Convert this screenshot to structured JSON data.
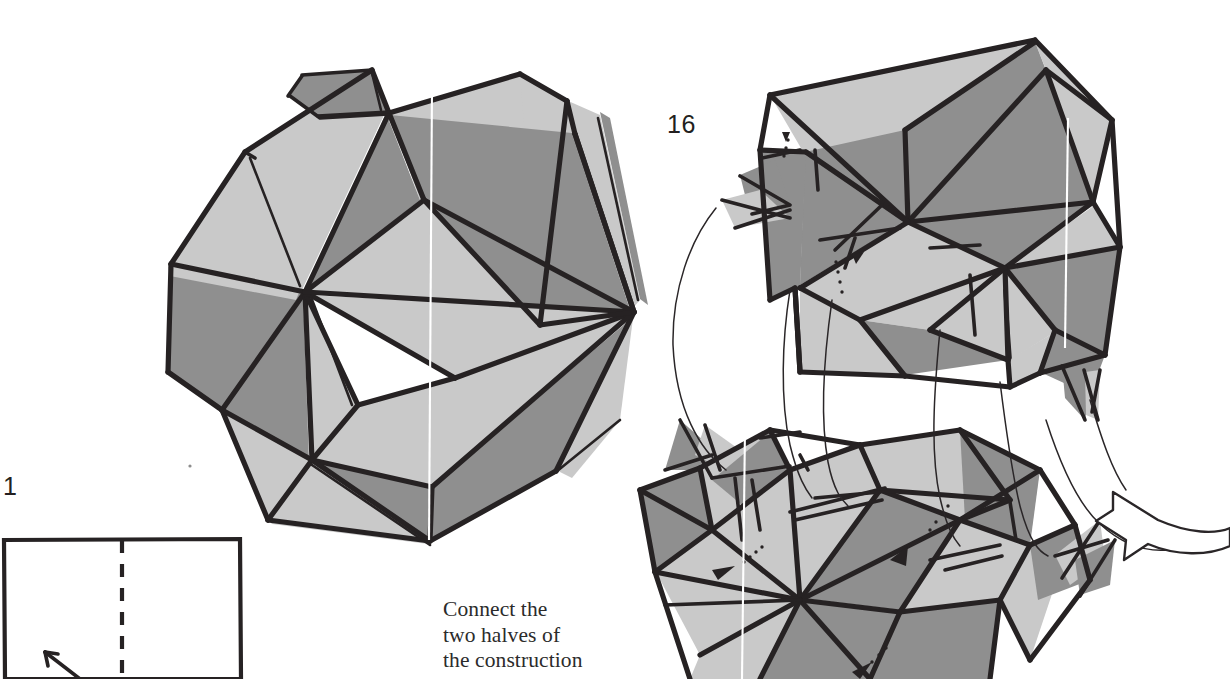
{
  "page": {
    "background": "#ffffff",
    "width": 1230,
    "height": 679,
    "kind": "origami-instruction-scan"
  },
  "palette": {
    "ink": "#231f20",
    "light_face": "#c9c9c9",
    "dark_face": "#8f8f8f",
    "mid_face": "#b0b0b0",
    "paper": "#ffffff",
    "caption_text": "#2b2b2b",
    "seam_highlight": "#ffffff"
  },
  "labels": {
    "step_one": "1",
    "step_sixteen": "16"
  },
  "caption": {
    "line1": "Connect the",
    "line2": "two halves of",
    "line3": "the construction"
  },
  "figures": {
    "assembled_model": {
      "name": "completed modular polyhedron",
      "position": "left-center"
    },
    "upper_half": {
      "name": "upper half of construction",
      "position": "upper-right"
    },
    "lower_half": {
      "name": "lower half of construction",
      "position": "lower-right"
    },
    "square_sheet": {
      "name": "square paper with vertical valley fold",
      "position": "bottom-left",
      "fold_style": "dashed"
    },
    "join_arrow": {
      "name": "curved hollow arrow pointing up-left",
      "position": "right-edge"
    }
  }
}
